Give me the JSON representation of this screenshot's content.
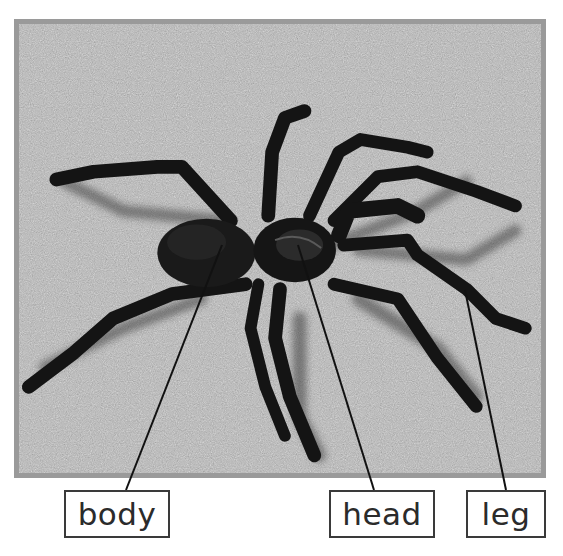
{
  "figure": {
    "colors": {
      "frame_border": "#9a9a9a",
      "sand": "#b8b8b8",
      "spider": "#141414",
      "label_border": "#3a3a3a",
      "label_text": "#2b2b2b",
      "leader_line": "#111111"
    }
  },
  "labels": [
    {
      "id": "body",
      "text": "body",
      "box": {
        "x": 64,
        "y": 490,
        "w": 106,
        "h": 48
      },
      "pointer_from": [
        222,
        245
      ],
      "pointer_to": [
        126,
        490
      ]
    },
    {
      "id": "head",
      "text": "head",
      "box": {
        "x": 329,
        "y": 490,
        "w": 106,
        "h": 48
      },
      "pointer_from": [
        298,
        245
      ],
      "pointer_to": [
        374,
        490
      ]
    },
    {
      "id": "leg",
      "text": "leg",
      "box": {
        "x": 466,
        "y": 490,
        "w": 80,
        "h": 48
      },
      "pointer_from": [
        465,
        290
      ],
      "pointer_to": [
        506,
        490
      ]
    }
  ]
}
